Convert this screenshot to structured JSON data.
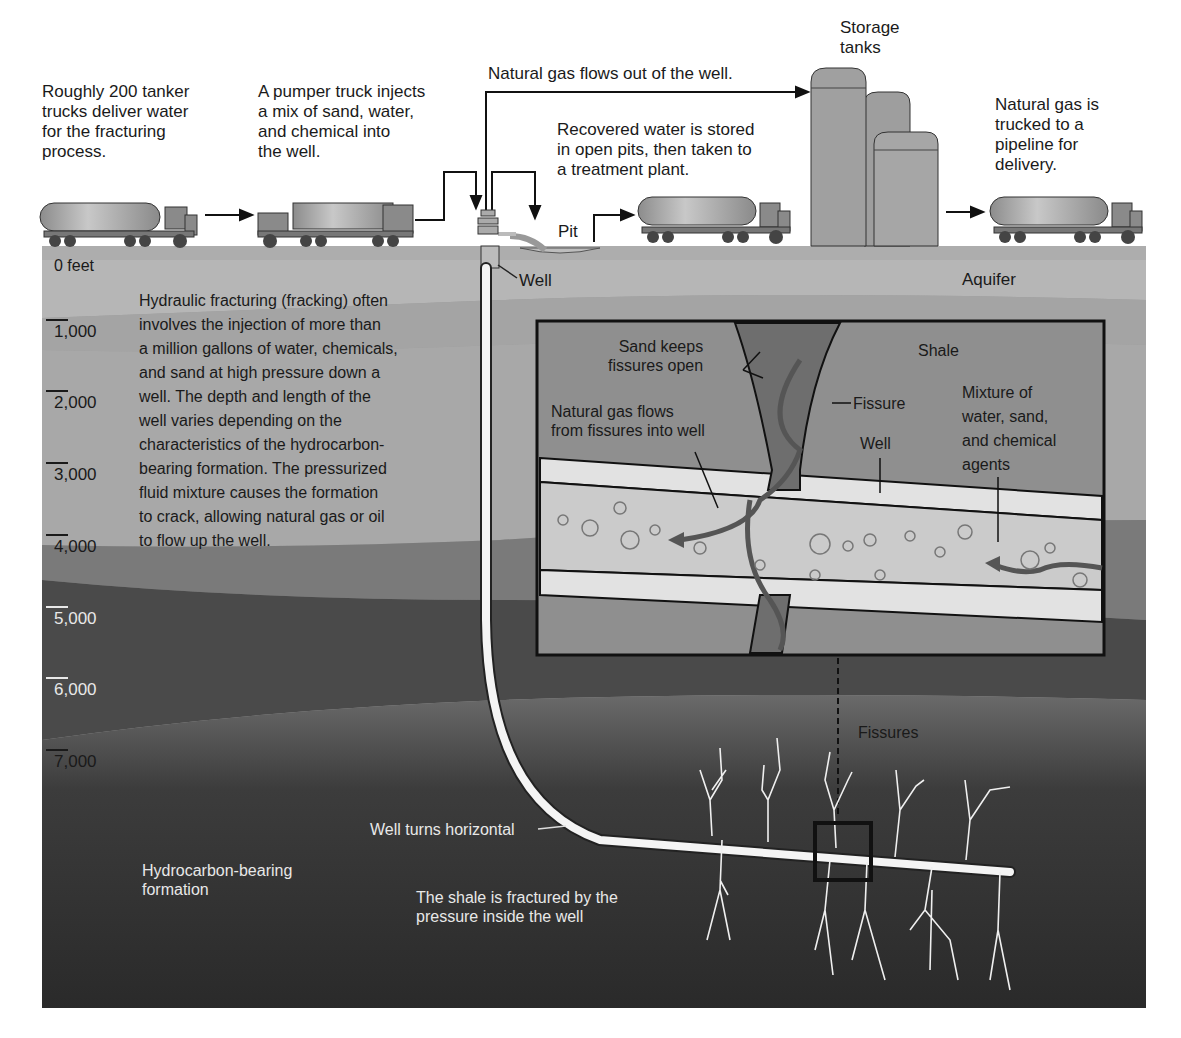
{
  "surface": {
    "tanker_caption": "Roughly 200 tanker\ntrucks deliver water\nfor the fracturing\nprocess.",
    "pumper_caption": "A pumper truck injects\na mix of sand, water,\nand chemical into\nthe well.",
    "gas_flow_caption": "Natural gas flows out of the well.",
    "recovered_water_caption": "Recovered water is stored\nin open pits, then taken to\na treatment plant.",
    "storage_caption": "Storage\ntanks",
    "delivery_caption": "Natural gas is\ntrucked to a\npipeline for\ndelivery.",
    "pit_label": "Pit",
    "well_label": "Well",
    "aquifer_label": "Aquifer"
  },
  "depth_scale": {
    "zero_label": "0 feet",
    "ticks": [
      "1,000",
      "2,000",
      "3,000",
      "4,000",
      "5,000",
      "6,000",
      "7,000"
    ]
  },
  "description": "Hydraulic fracturing (fracking) often\ninvolves the injection of more than\na million gallons of water, chemicals,\nand sand at high pressure down a\nwell. The depth and length of the\nwell varies depending on the\ncharacteristics of the hydrocarbon-\nbearing formation. The pressurized\nfluid mixture causes the formation\nto crack, allowing natural gas or oil\nto flow up the well.",
  "inset": {
    "sand_label": "Sand keeps\nfissures open",
    "shale_label": "Shale",
    "fissure_label": "Fissure",
    "gas_flow_label": "Natural gas flows\nfrom fissures into well",
    "well_label": "Well",
    "mixture_label": "Mixture of\nwater, sand,\nand chemical\nagents"
  },
  "underground": {
    "fissures_label": "Fissures",
    "horizontal_label": "Well turns horizontal",
    "formation_label": "Hydrocarbon-bearing\nformation",
    "fracture_label": "The shale is fractured by the\npressure inside the well"
  },
  "colors": {
    "sky": "#ffffff",
    "ground_surface": "#a9a9a9",
    "aquifer": "#b4b4b4",
    "layer_mid": "#9a9a9a",
    "layer_dark": "#555555",
    "formation": "#2e2e2e",
    "inset_bg": "#8f8f8f",
    "well_white": "#f4f4f4"
  }
}
